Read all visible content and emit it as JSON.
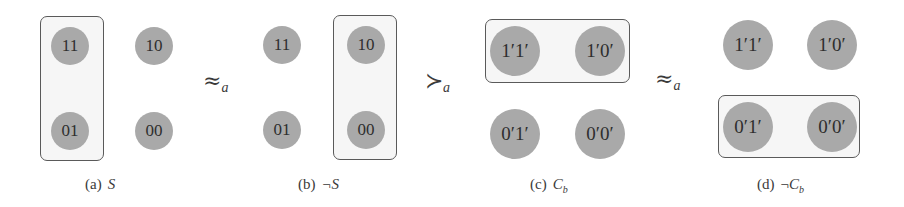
{
  "colors": {
    "node_fill": "#a9a9a9",
    "node_text": "#2e2e2e",
    "box_border": "#5a5a5a",
    "box_fill": "#f6f6f6"
  },
  "panels": [
    {
      "id": "a",
      "caption_label": "(a)",
      "caption_symbol": "S",
      "nodes": [
        "11",
        "10",
        "01",
        "00"
      ],
      "grouped": [
        "11",
        "01"
      ]
    },
    {
      "id": "b",
      "caption_label": "(b)",
      "caption_symbol": "¬S",
      "nodes": [
        "11",
        "10",
        "01",
        "00"
      ],
      "grouped": [
        "10",
        "00"
      ]
    },
    {
      "id": "c",
      "caption_label": "(c)",
      "caption_symbol": "C_b",
      "nodes": [
        "1′1′",
        "1′0′",
        "0′1′",
        "0′0′"
      ],
      "grouped": [
        "1′1′",
        "1′0′"
      ]
    },
    {
      "id": "d",
      "caption_label": "(d)",
      "caption_symbol": "¬C_b",
      "nodes": [
        "1′1′",
        "1′0′",
        "0′1′",
        "0′0′"
      ],
      "grouped": [
        "0′1′",
        "0′0′"
      ]
    }
  ],
  "relations": [
    {
      "symbol": "≈",
      "subscript": "a"
    },
    {
      "symbol": "≻",
      "subscript": "a"
    },
    {
      "symbol": "≈",
      "subscript": "a"
    }
  ],
  "caption_parts": {
    "c_main": "C",
    "c_sub": "b",
    "d_neg": "¬",
    "d_main": "C",
    "d_sub": "b"
  }
}
